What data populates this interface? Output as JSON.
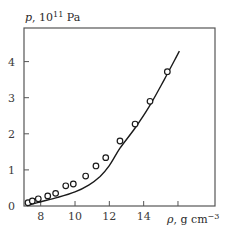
{
  "chart_data": {
    "type": "scatter",
    "title": "",
    "xlabel": "ρ, g cm⁻³",
    "ylabel": "p, 10¹¹ Pa",
    "xlabel_parts": {
      "symbol": "ρ",
      "unit": ", g cm",
      "exp": "−3"
    },
    "ylabel_parts": {
      "symbol": "p",
      "unit": ", 10",
      "exp": "11",
      "tail": " Pa"
    },
    "xlim": [
      7.0,
      18.1
    ],
    "ylim": [
      -0.03,
      4.9
    ],
    "xticks": [
      8,
      10,
      12,
      14,
      16
    ],
    "xtick_labels": [
      "8",
      "10",
      "12",
      "14"
    ],
    "yticks": [
      0,
      1,
      2,
      3,
      4
    ],
    "ytick_labels": [
      "0",
      "1",
      "2",
      "3",
      "4"
    ],
    "grid": false,
    "legend": null,
    "series": [
      {
        "name": "measured",
        "kind": "scatter",
        "marker": "open-circle",
        "x": [
          7.26,
          7.51,
          7.86,
          8.41,
          8.87,
          9.46,
          9.9,
          10.62,
          11.22,
          11.79,
          12.62,
          13.5,
          14.37,
          15.38
        ],
        "y": [
          0.09,
          0.14,
          0.2,
          0.28,
          0.35,
          0.56,
          0.61,
          0.83,
          1.11,
          1.34,
          1.8,
          2.27,
          2.9,
          3.72
        ]
      },
      {
        "name": "theory",
        "kind": "line",
        "x": [
          7.2,
          7.96,
          9.0,
          10.0,
          10.8,
          11.46,
          12.0,
          12.62,
          13.5,
          14.33,
          15.2,
          16.08
        ],
        "y": [
          0.01,
          0.11,
          0.24,
          0.39,
          0.58,
          0.82,
          1.12,
          1.6,
          2.16,
          2.76,
          3.5,
          4.29
        ]
      }
    ]
  },
  "colors": {
    "axis": "#555555",
    "ink": "#1a1a1a",
    "background": "#ffffff"
  }
}
